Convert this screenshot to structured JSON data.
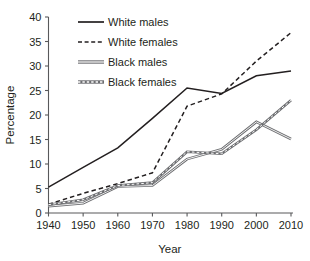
{
  "chart_data": {
    "type": "line",
    "title": "",
    "xlabel": "Year",
    "ylabel": "Percentage",
    "x": [
      1940,
      1950,
      1960,
      1970,
      1980,
      1990,
      2000,
      2010
    ],
    "xtick_labels": [
      "1940",
      "1950",
      "1960",
      "1970",
      "1980",
      "1990",
      "2000",
      "2010"
    ],
    "ytick_labels": [
      "0",
      "5",
      "10",
      "15",
      "20",
      "25",
      "30",
      "35",
      "40"
    ],
    "ytick_values": [
      0,
      5,
      10,
      15,
      20,
      25,
      30,
      35,
      40
    ],
    "xlim": [
      1940,
      2010
    ],
    "ylim": [
      0,
      40
    ],
    "grid": false,
    "legend_position": "top-left",
    "series": [
      {
        "name": "White males",
        "values": [
          5.3,
          9.3,
          13.3,
          19.3,
          25.5,
          24.4,
          28.0,
          29.0
        ],
        "style": "solid",
        "color": "#231f20",
        "width": 1.5
      },
      {
        "name": "White females",
        "values": [
          1.8,
          4.0,
          6.0,
          8.2,
          21.8,
          24.3,
          31.0,
          36.8
        ],
        "style": "dashed",
        "color": "#231f20",
        "width": 1.5
      },
      {
        "name": "Black males",
        "values": [
          1.4,
          2.0,
          5.4,
          5.6,
          11.0,
          13.0,
          18.6,
          15.1
        ],
        "style": "solid-double",
        "color": "#6d6e71",
        "width": 2.6
      },
      {
        "name": "Black females",
        "values": [
          1.7,
          2.7,
          5.6,
          6.2,
          12.5,
          12.1,
          17.0,
          23.0
        ],
        "style": "dotted",
        "color": "#6d6e71",
        "width": 2.6
      }
    ]
  },
  "legend": {
    "items": [
      {
        "label": "White males",
        "swatch": "solid-black-line-swatch"
      },
      {
        "label": "White females",
        "swatch": "dashed-black-line-swatch"
      },
      {
        "label": "Black males",
        "swatch": "solid-gray-line-swatch"
      },
      {
        "label": "Black females",
        "swatch": "dotted-gray-line-swatch"
      }
    ]
  }
}
